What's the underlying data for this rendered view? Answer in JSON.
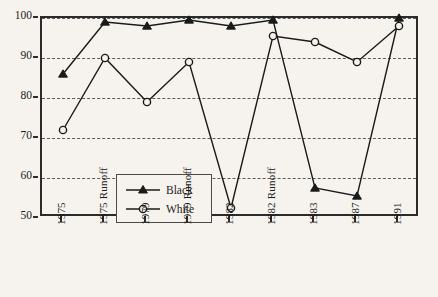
{
  "chart_data": {
    "type": "line",
    "title": "",
    "subtitle": "",
    "xlabel": "",
    "ylabel": "",
    "categories": [
      "1975",
      "1975 Runoff",
      "1979",
      "1979 Runoff",
      "1982",
      "1982 Runoff",
      "1983",
      "1987",
      "1991"
    ],
    "series": [
      {
        "name": "Black",
        "marker": "filled-triangle",
        "color": "#1a1a1a",
        "values": [
          86,
          99,
          98,
          99.5,
          98,
          99.5,
          57.5,
          55.5,
          100
        ]
      },
      {
        "name": "White",
        "marker": "open-circle",
        "color": "#1a1a1a",
        "values": [
          72,
          90,
          79,
          89,
          52.5,
          95.5,
          94,
          89,
          98
        ]
      }
    ],
    "ylim": [
      50,
      100
    ],
    "yticks": [
      50,
      60,
      70,
      80,
      90,
      100
    ],
    "ytick_labels": [
      "50",
      "60",
      "70",
      "80",
      "90",
      "100"
    ],
    "grid": true,
    "grid_style": "dashed-horizontal",
    "legend_position": "inside-lower-left",
    "legend_entries": [
      "Black",
      "White"
    ],
    "background_color": "#f6f3ee",
    "axis_color": "#2b2b2b"
  },
  "legend": {
    "items": [
      {
        "label": "Black"
      },
      {
        "label": "White"
      }
    ]
  }
}
